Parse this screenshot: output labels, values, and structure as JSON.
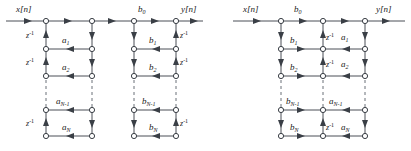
{
  "figure": {
    "caption_faint": "",
    "diagram_count": 2,
    "line_color": "#4a4f57",
    "node_fill": "#ffffff",
    "node_stroke": "#3a3f46",
    "text_color": "#1a1a1a",
    "dashed_color": "#6b7078"
  },
  "diagrams": [
    {
      "id": "left",
      "name": "direct-form-i",
      "input_label": "x[n]",
      "output_label": "y[n]",
      "feedforward_gain": "b",
      "feedforward_gain_sub": "0",
      "delay_label": "z",
      "delay_exponent": "-1",
      "left_section": {
        "name": "feedback-a-section",
        "coefficients": [
          {
            "base": "a",
            "sub": "1"
          },
          {
            "base": "a",
            "sub": "2"
          },
          {
            "base": "a",
            "sub": "N-1"
          },
          {
            "base": "a",
            "sub": "N"
          }
        ],
        "delays": [
          "z",
          "z",
          "z"
        ],
        "delay_exponent": "-1"
      },
      "right_section": {
        "name": "feedforward-b-section",
        "coefficients": [
          {
            "base": "b",
            "sub": "1"
          },
          {
            "base": "b",
            "sub": "2"
          },
          {
            "base": "b",
            "sub": "N-1"
          },
          {
            "base": "b",
            "sub": "N"
          }
        ],
        "delays": [
          "z",
          "z",
          "z"
        ],
        "delay_exponent": "-1"
      }
    },
    {
      "id": "right",
      "name": "direct-form-ii",
      "input_label": "x[n]",
      "output_label": "y[n]",
      "feedforward_gain": "b",
      "feedforward_gain_sub": "0",
      "delay_label": "z",
      "delay_exponent": "-1",
      "b_coefficients": [
        {
          "base": "b",
          "sub": "1"
        },
        {
          "base": "b",
          "sub": "2"
        },
        {
          "base": "b",
          "sub": "N-1"
        },
        {
          "base": "b",
          "sub": "N"
        }
      ],
      "a_coefficients": [
        {
          "base": "a",
          "sub": "1"
        },
        {
          "base": "a",
          "sub": "2"
        },
        {
          "base": "a",
          "sub": "N-1"
        },
        {
          "base": "a",
          "sub": "N"
        }
      ],
      "delays": [
        "z",
        "z",
        "z"
      ]
    }
  ],
  "labels": {
    "x_left": "x[n]",
    "y_left": "y[n]",
    "b0_left": "b",
    "b0_left_sub": "0",
    "x_right": "x[n]",
    "y_right": "y[n]",
    "b0_right": "b",
    "b0_right_sub": "0",
    "z_text": "z",
    "z_exp": "-1",
    "a1": "a",
    "a1s": "1",
    "a2": "a",
    "a2s": "2",
    "aN1": "a",
    "aN1s": "N-1",
    "aN": "a",
    "aNs": "N",
    "b1": "b",
    "b1s": "1",
    "b2": "b",
    "b2s": "2",
    "bN1": "b",
    "bN1s": "N-1",
    "bN": "b",
    "bNs": "N"
  }
}
